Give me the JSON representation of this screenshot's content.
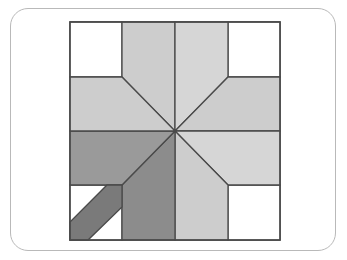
{
  "page": {
    "background_color": "#ffffff"
  },
  "card": {
    "name": "figure-card",
    "border_color": "#b9b9b9",
    "fill_color": "#ffffff",
    "corner_radius": "18"
  },
  "figure": {
    "title": "Eight-pointed LeMoyne star quilt block with corner shadow band",
    "frame": {
      "label": "block-outline",
      "x": 70,
      "y": 22,
      "width": 210,
      "height": 218,
      "stroke_color": "#4a4a4a",
      "fill_color": "#ffffff"
    },
    "center_point": {
      "x": 175,
      "y": 131
    },
    "stroke_color": "#4a4a4a",
    "stroke_width": "1.3",
    "palette": {
      "white": "#ffffff",
      "light_gray": "#cdcdcd",
      "pale_gray": "#d6d6d6",
      "medium_gray": "#9a9a9a",
      "mid_dark_gray": "#8c8c8c",
      "dark_gray": "#7a7a7a",
      "outline": "#4a4a4a"
    },
    "star_points": [
      {
        "name": "point-north-west-blade",
        "shade_label": "light_gray",
        "fill": "#cdcdcd",
        "points": "122,22 175,22 175,131 122,77"
      },
      {
        "name": "point-north-east-blade",
        "shade_label": "pale_gray",
        "fill": "#d6d6d6",
        "points": "175,22 228,22 228,77 175,131"
      },
      {
        "name": "point-east-upper-blade",
        "shade_label": "light_gray",
        "fill": "#cdcdcd",
        "points": "228,77 280,77 280,131 175,131"
      },
      {
        "name": "point-east-lower-blade",
        "shade_label": "pale_gray",
        "fill": "#d6d6d6",
        "points": "175,131 280,131 280,185 228,185"
      },
      {
        "name": "point-south-east-blade",
        "shade_label": "light_gray",
        "fill": "#cdcdcd",
        "points": "175,131 228,185 228,240 175,240"
      },
      {
        "name": "point-south-west-blade",
        "shade_label": "mid_dark_gray",
        "fill": "#8c8c8c",
        "points": "175,131 175,240 122,240 122,185"
      },
      {
        "name": "point-west-lower-blade",
        "shade_label": "medium_gray",
        "fill": "#9a9a9a",
        "points": "175,131 122,185 70,185 70,131"
      },
      {
        "name": "point-west-upper-blade",
        "shade_label": "light_gray",
        "fill": "#cdcdcd",
        "points": "70,77 122,77 175,131 70,131"
      }
    ],
    "corner_squares": [
      {
        "name": "corner-square-top-left",
        "fill": "#ffffff",
        "points": "70,22 122,22 122,77 70,77"
      },
      {
        "name": "corner-square-top-right",
        "fill": "#ffffff",
        "points": "228,22 280,22 280,77 228,77"
      },
      {
        "name": "corner-square-bottom-right",
        "fill": "#ffffff",
        "points": "228,185 280,185 280,240 228,240"
      },
      {
        "name": "corner-square-bottom-left",
        "fill": "#ffffff",
        "points": "70,185 122,185 122,240 70,240"
      }
    ],
    "shadow_band": {
      "name": "corner-shadow-band",
      "shade_label": "dark_gray",
      "fill": "#7a7a7a",
      "points": "122,185 122,207 88,240 70,240 70,222 107,185",
      "description": "dark diagonal band crossing the bottom-left corner square"
    }
  }
}
